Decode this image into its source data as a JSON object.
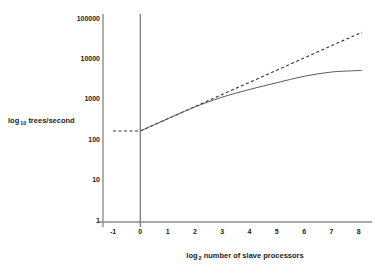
{
  "figure": {
    "y_axis_title": {
      "prefix": "log",
      "sub": "10",
      "rest": "trees/second"
    },
    "x_axis_title": {
      "prefix": "log",
      "sub": "2",
      "rest": "number of slave processors"
    }
  },
  "chart_data": {
    "type": "line",
    "title": "",
    "xlabel": "log2 number of slave processors",
    "ylabel": "log10 trees/second",
    "x_scale": "linear",
    "y_scale": "log10",
    "xlim": [
      -1,
      8
    ],
    "ylim": [
      1,
      100000
    ],
    "x_ticks": [
      -1,
      0,
      1,
      2,
      3,
      4,
      5,
      6,
      7,
      8
    ],
    "y_ticks": [
      1,
      10,
      100,
      1000,
      10000,
      100000
    ],
    "grid": false,
    "legend": "none",
    "annotations": [
      {
        "type": "vline",
        "x": 0
      }
    ],
    "series": [
      {
        "name": "ideal linear speedup",
        "style": "dashed",
        "x": [
          -1,
          0,
          1,
          2,
          3,
          4,
          5,
          6,
          7,
          8
        ],
        "values": [
          160,
          160,
          320,
          640,
          1280,
          2560,
          5120,
          10240,
          20480,
          40960
        ]
      },
      {
        "name": "measured trees per second",
        "style": "solid",
        "x": [
          0,
          1,
          2,
          3,
          4,
          5,
          6,
          7,
          8
        ],
        "values": [
          160,
          320,
          630,
          1100,
          1700,
          2500,
          3600,
          4600,
          5000
        ]
      }
    ],
    "colors": {
      "axis": "#7a7a7a",
      "dashed_line": "#333333",
      "solid_line": "#5a5a5a",
      "text": "#1b1b1b"
    }
  }
}
